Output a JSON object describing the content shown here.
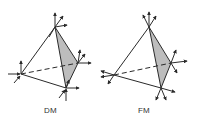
{
  "colors": {
    "line": "#2a2a2a",
    "face": "#bdbdbd",
    "background": "#ffffff"
  },
  "diagrams": [
    {
      "label": "DM",
      "vertices": {
        "top": [
          55,
          27
        ],
        "left": [
          21,
          74
        ],
        "right": [
          78,
          63
        ],
        "bottom": [
          66,
          88
        ]
      },
      "shaded_face": [
        "top",
        "right",
        "bottom"
      ],
      "hidden_edge": [
        "left",
        "right"
      ]
    },
    {
      "label": "FM",
      "vertices": {
        "top": [
          149,
          27
        ],
        "left": [
          114,
          75
        ],
        "right": [
          171,
          63
        ],
        "bottom": [
          161,
          88
        ]
      },
      "shaded_face": [
        "top",
        "right",
        "bottom"
      ],
      "hidden_edge": [
        "left",
        "right"
      ]
    }
  ]
}
